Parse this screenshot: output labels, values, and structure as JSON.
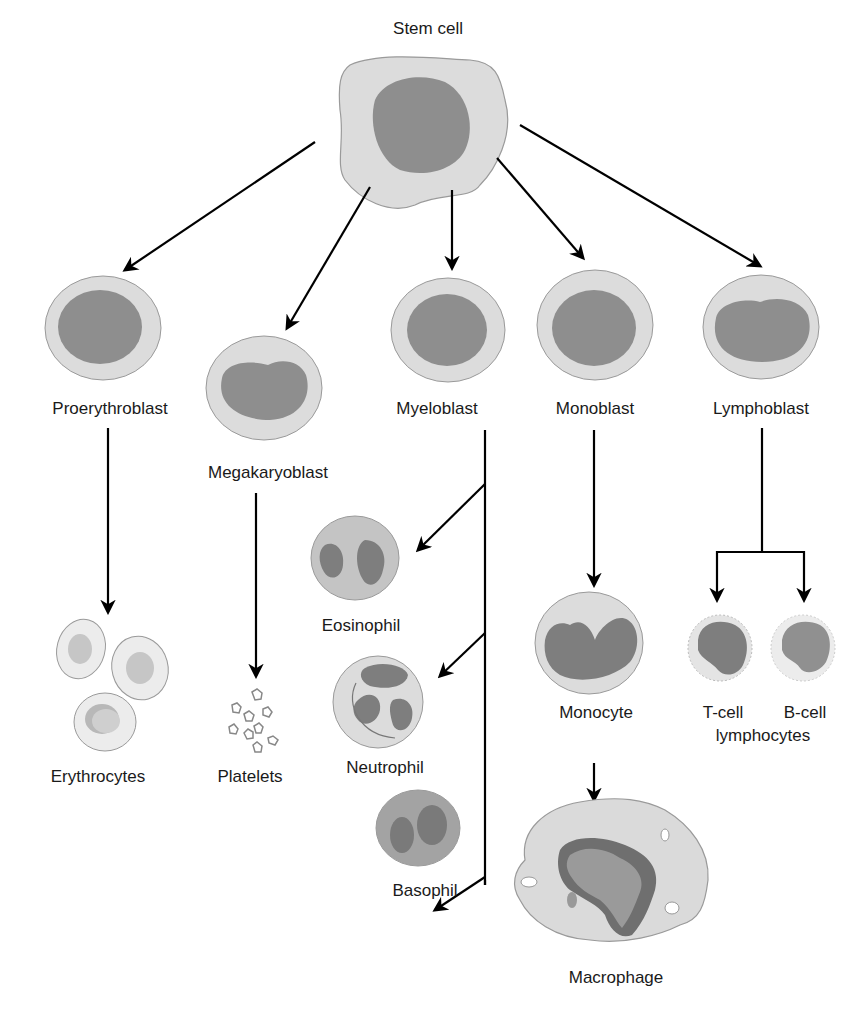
{
  "colors": {
    "cytoplasm": "#dcdcdc",
    "nucleus": "#8e8e8e",
    "outline": "#9a9a9a",
    "arrow": "#000000",
    "background": "#ffffff"
  },
  "nodes": {
    "stem_cell": {
      "label": "Stem cell"
    },
    "proerythroblast": {
      "label": "Proerythroblast"
    },
    "megakaryoblast": {
      "label": "Megakaryoblast"
    },
    "myeloblast": {
      "label": "Myeloblast"
    },
    "monoblast": {
      "label": "Monoblast"
    },
    "lymphoblast": {
      "label": "Lymphoblast"
    },
    "erythrocytes": {
      "label": "Erythrocytes"
    },
    "platelets": {
      "label": "Platelets"
    },
    "eosinophil": {
      "label": "Eosinophil"
    },
    "neutrophil": {
      "label": "Neutrophil"
    },
    "basophil": {
      "label": "Basophil"
    },
    "monocyte": {
      "label": "Monocyte"
    },
    "macrophage": {
      "label": "Macrophage"
    },
    "t_cell": {
      "label": "T-cell"
    },
    "b_cell": {
      "label": "B-cell"
    },
    "lymphocytes": {
      "label": "lymphocytes"
    }
  },
  "edges": [
    {
      "from": "Stem cell",
      "to": "Proerythroblast"
    },
    {
      "from": "Stem cell",
      "to": "Megakaryoblast"
    },
    {
      "from": "Stem cell",
      "to": "Myeloblast"
    },
    {
      "from": "Stem cell",
      "to": "Monoblast"
    },
    {
      "from": "Stem cell",
      "to": "Lymphoblast"
    },
    {
      "from": "Proerythroblast",
      "to": "Erythrocytes"
    },
    {
      "from": "Megakaryoblast",
      "to": "Platelets"
    },
    {
      "from": "Myeloblast",
      "to": "Eosinophil"
    },
    {
      "from": "Myeloblast",
      "to": "Neutrophil"
    },
    {
      "from": "Myeloblast",
      "to": "Basophil"
    },
    {
      "from": "Monoblast",
      "to": "Monocyte"
    },
    {
      "from": "Monocyte",
      "to": "Macrophage"
    },
    {
      "from": "Lymphoblast",
      "to": "T-cell"
    },
    {
      "from": "Lymphoblast",
      "to": "B-cell"
    }
  ]
}
